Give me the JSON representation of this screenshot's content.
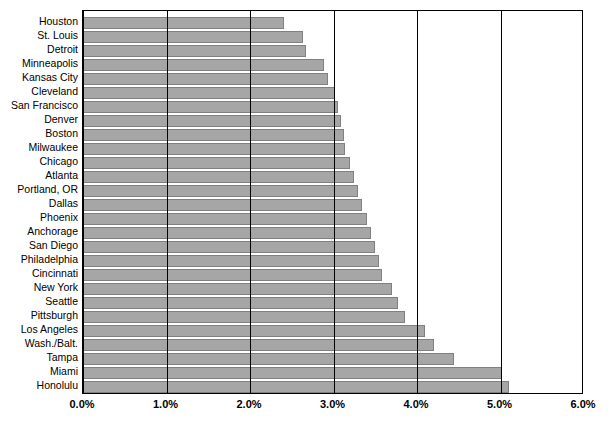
{
  "chart_data": {
    "type": "bar",
    "orientation": "horizontal",
    "title": "",
    "xlabel": "",
    "ylabel": "",
    "xlim": [
      0,
      6
    ],
    "xticks": [
      0,
      1,
      2,
      3,
      4,
      5,
      6
    ],
    "xtick_labels": [
      "0.0%",
      "1.0%",
      "2.0%",
      "3.0%",
      "4.0%",
      "5.0%",
      "6.0%"
    ],
    "grid": true,
    "legend": false,
    "bar_color": "#a6a6a6",
    "bar_border_color": "#808080",
    "categories": [
      "Houston",
      "St. Louis",
      "Detroit",
      "Minneapolis",
      "Kansas City",
      "Cleveland",
      "San Francisco",
      "Denver",
      "Boston",
      "Milwaukee",
      "Chicago",
      "Atlanta",
      "Portland, OR",
      "Dallas",
      "Phoenix",
      "Anchorage",
      "San Diego",
      "Philadelphia",
      "Cincinnati",
      "New York",
      "Seattle",
      "Pittsburgh",
      "Los Angeles",
      "Wash./Balt.",
      "Tampa",
      "Miami",
      "Honolulu"
    ],
    "values": [
      2.41,
      2.63,
      2.67,
      2.89,
      2.93,
      3.02,
      3.05,
      3.09,
      3.13,
      3.14,
      3.2,
      3.25,
      3.29,
      3.34,
      3.4,
      3.45,
      3.5,
      3.55,
      3.58,
      3.7,
      3.77,
      3.86,
      4.1,
      4.2,
      4.44,
      5.02,
      5.1
    ],
    "value_labels": [
      "2.4%",
      "2.6%",
      "2.7%",
      "2.9%",
      "2.9%",
      "3.0%",
      "3.1%",
      "3.1%",
      "3.1%",
      "3.1%",
      "3.2%",
      "3.3%",
      "3.3%",
      "3.3%",
      "3.4%",
      "3.5%",
      "3.5%",
      "3.6%",
      "3.6%",
      "3.7%",
      "3.8%",
      "3.9%",
      "4.1%",
      "4.2%",
      "4.4%",
      "5.0%",
      "5.1%"
    ]
  }
}
